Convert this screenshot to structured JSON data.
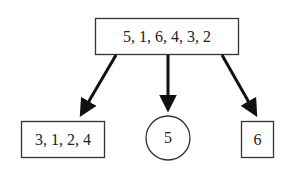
{
  "diagram": {
    "type": "partition-tree",
    "root": {
      "label": "5, 1, 6, 4, 3, 2",
      "shape": "rectangle"
    },
    "children": [
      {
        "label": "3, 1, 2, 4",
        "shape": "rectangle"
      },
      {
        "label": "5",
        "shape": "circle"
      },
      {
        "label": "6",
        "shape": "rectangle"
      }
    ],
    "colors": {
      "stroke": "#222222",
      "arrow": "#111111",
      "background": "#ffffff"
    }
  }
}
